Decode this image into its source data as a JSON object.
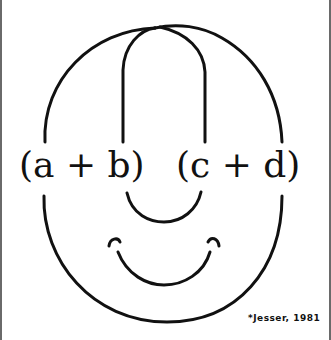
{
  "diagram": {
    "left_expression": "(a + b)",
    "right_expression": "(c + d)",
    "credit": "*Jesser, 1981",
    "stroke_color": "#111111",
    "border_color": "#6a6a6a",
    "elements": [
      "face-outline",
      "nose-loop",
      "nose-bottom-arc",
      "smile",
      "smile-left-dimple",
      "smile-right-dimple"
    ]
  }
}
